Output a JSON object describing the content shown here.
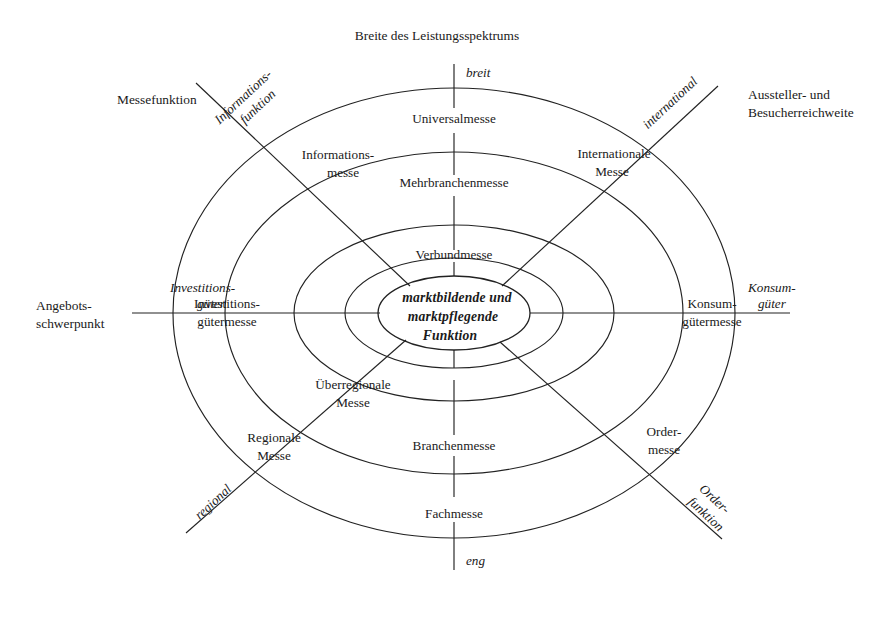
{
  "figure": {
    "title": "Breite des Leistungsspektrums",
    "axes": {
      "vertical": {
        "name": "Breite des Leistungsspektrums",
        "top_pole": "breit",
        "bottom_pole": "eng"
      },
      "horizontal": {
        "name": "Angebots-\nschwerpunkt",
        "name_line1": "Angebots-",
        "name_line2": "schwerpunkt",
        "left_pole_line1": "Investitions-",
        "left_pole_line2": "güter",
        "right_pole_line1": "Konsum-",
        "right_pole_line2": "güter"
      },
      "diagonal_nwse": {
        "name": "Messefunktion",
        "nw_pole_line1": "Informations-",
        "nw_pole_line2": "funktion",
        "se_pole_line1": "Order-",
        "se_pole_line2": "funktion"
      },
      "diagonal_swne": {
        "name_line1": "Aussteller- und",
        "name_line2": "Besucherreichweite",
        "sw_pole": "regional",
        "ne_pole": "international"
      }
    },
    "center": {
      "line1": "marktbildende und",
      "line2": "marktpflegende",
      "line3": "Funktion"
    },
    "sector_labels": {
      "top_outer": "Universalmesse",
      "top_ring2": "Mehrbranchenmesse",
      "top_ring3": "Verbundmesse",
      "bottom_outer": "Fachmesse",
      "bottom_ring2": "Branchenmesse",
      "left_outer_line1": "Investitions-",
      "left_outer_line2": "gütermesse",
      "right_outer_line1": "Konsum-",
      "right_outer_line2": "gütermesse",
      "nw_outer_line1": "Informations-",
      "nw_outer_line2": "messe",
      "ne_outer_line1": "Internationale",
      "ne_outer_line2": "Messe",
      "sw_outer_line1": "Regionale",
      "sw_outer_line2": "Messe",
      "sw_inner_line1": "Überregionale",
      "sw_inner_line2": "Messe",
      "se_outer_line1": "Order-",
      "se_outer_line2": "messe"
    },
    "colors": {
      "stroke": "#222222",
      "text": "#1a1a1a",
      "background": "#ffffff"
    }
  }
}
